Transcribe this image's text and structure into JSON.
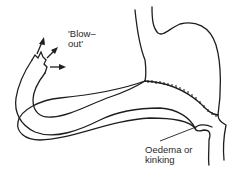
{
  "diagram": {
    "labels": {
      "blowout_line1": "'Blow–",
      "blowout_line2": "out'",
      "oedema_line1": "Oedema or",
      "oedema_line2": "kinking"
    },
    "colors": {
      "stroke": "#1e1e1e",
      "background": "#ffffff"
    }
  }
}
